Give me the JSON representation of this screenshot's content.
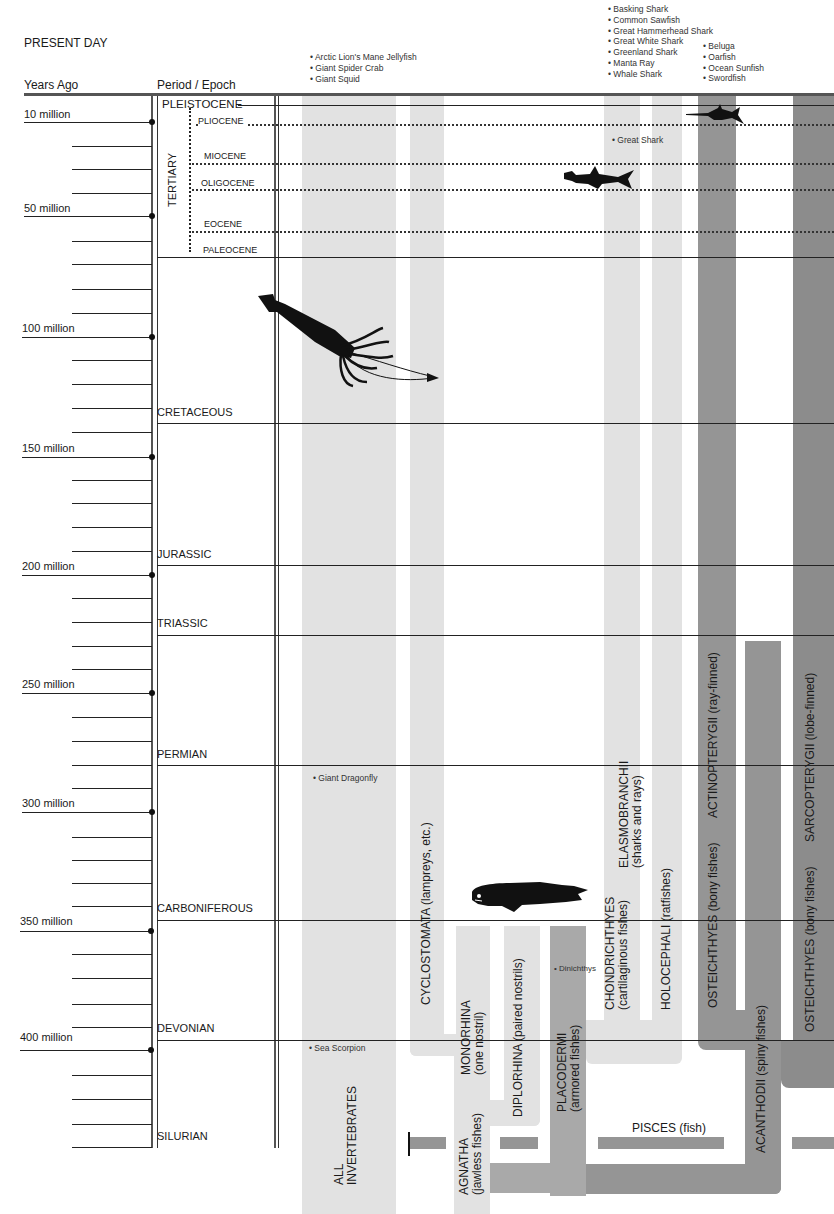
{
  "header": {
    "present_day": "PRESENT DAY",
    "years_ago": "Years Ago",
    "period_epoch": "Period / Epoch"
  },
  "time_axis": {
    "labels": [
      {
        "label": "10 million",
        "y": 122
      },
      {
        "label": "50 million",
        "y": 216
      },
      {
        "label": "100 million",
        "y": 337
      },
      {
        "label": "150 million",
        "y": 457
      },
      {
        "label": "200 million",
        "y": 575
      },
      {
        "label": "250 million",
        "y": 693
      },
      {
        "label": "300 million",
        "y": 812
      },
      {
        "label": "350 million",
        "y": 931
      },
      {
        "label": "400 million",
        "y": 1050
      }
    ]
  },
  "periods": [
    {
      "name": "PLEISTOCENE",
      "y": 104
    },
    {
      "name": "CRETACEOUS",
      "y": 423
    },
    {
      "name": "JURASSIC",
      "y": 566
    },
    {
      "name": "TRIASSIC",
      "y": 636
    },
    {
      "name": "PERMIAN",
      "y": 765
    },
    {
      "name": "CARBONIFEROUS",
      "y": 920
    },
    {
      "name": "DEVONIAN",
      "y": 1040
    },
    {
      "name": "SILURIAN",
      "y": 1146
    }
  ],
  "tertiary": {
    "label": "TERTIARY",
    "epochs": [
      {
        "name": "PLIOCENE",
        "y": 123
      },
      {
        "name": "MIOCENE",
        "y": 162
      },
      {
        "name": "OLIGOCENE",
        "y": 189
      },
      {
        "name": "EOCENE",
        "y": 231
      },
      {
        "name": "PALEOCENE",
        "y": 256
      }
    ]
  },
  "species_lists": {
    "invertebrates": [
      "Arctic Lion's Mane Jellyfish",
      "Giant Spider Crab",
      "Giant Squid"
    ],
    "sharks": [
      "Basking Shark",
      "Common Sawfish",
      "Great Hammerhead Shark",
      "Great White Shark",
      "Greenland Shark",
      "Manta Ray",
      "Whale Shark"
    ],
    "bony_fish": [
      "Beluga",
      "Oarfish",
      "Ocean Sunfish",
      "Swordfish"
    ]
  },
  "fossil_notes": {
    "great_shark": "Great Shark",
    "giant_dragonfly": "Giant Dragonfly",
    "dinichthys": "Dinichthys",
    "sea_scorpion": "Sea Scorpion"
  },
  "groups": {
    "all_invertebrates": "ALL\nINVERTEBRATES",
    "all_label_1": "ALL",
    "all_label_2": "INVERTEBRATES",
    "cyclostomata": "CYCLOSTOMATA (lampreys, etc.)",
    "monorhina_1": "MONORHINA",
    "monorhina_2": "(one nostril)",
    "diplorhina": "DIPLORHINA (paired nostrils)",
    "agnatha_1": "AGNATHA",
    "agnatha_2": "(jawless fishes)",
    "placodermi_1": "PLACODERMI",
    "placodermi_2": "(armored fishes)",
    "chondrichthyes_1": "CHONDRICHTHYES",
    "chondrichthyes_2": "(cartilaginous fishes)",
    "elasmobranchii_1": "ELASMOBRANCHII",
    "elasmobranchii_2": "(sharks and rays)",
    "holocephali": "HOLOCEPHALI (ratfishes)",
    "osteichthyes_a": "OSTEICHTHYES (bony fishes)",
    "actinopterygii": "ACTINOPTERYGII (ray-finned)",
    "acanthodii": "ACANTHODII (spiny fishes)",
    "osteichthyes_b": "OSTEICHTHYES (bony fishes)",
    "sarcopterygii": "SARCOPTERYGII (lobe-finned)",
    "pisces": "PISCES (fish)"
  },
  "illustrations": [
    "giant-squid",
    "hammerhead-shark",
    "swordfish",
    "dinichthys"
  ],
  "colors": {
    "light_band": "#e2e2e2",
    "mid_band": "#d4d4d4",
    "dark_band": "#a9a9a9",
    "darker_band": "#8c8c8c"
  }
}
